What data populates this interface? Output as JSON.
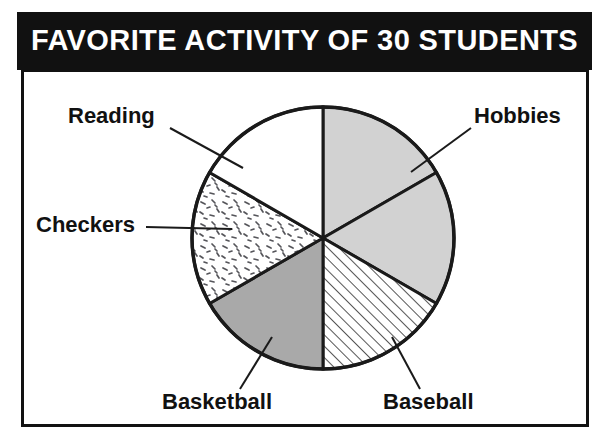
{
  "title": "FAVORITE ACTIVITY OF 30 STUDENTS",
  "labels": {
    "reading": "Reading",
    "checkers": "Checkers",
    "hobbies": "Hobbies",
    "basketball": "Basketball",
    "baseball": "Baseball"
  },
  "colors": {
    "banner_background": "#111111",
    "banner_text": "#ffffff",
    "frame_border": "#111111",
    "sector_outline": "#1a1a1a",
    "light_gray": "#d2d2d2",
    "mid_gray": "#a9a9a9",
    "white": "#ffffff"
  },
  "chart_data": {
    "type": "pie",
    "title": "FAVORITE ACTIVITY OF 30 STUDENTS",
    "total_students": 30,
    "categories": [
      "Hobbies",
      "Hobbies (second sector)",
      "Baseball",
      "Basketball",
      "Checkers",
      "Reading"
    ],
    "labeled_categories": [
      "Reading",
      "Hobbies",
      "Checkers",
      "Basketball",
      "Baseball"
    ],
    "slices": [
      {
        "label": "Hobbies",
        "value": 5,
        "fraction": 0.1667,
        "percent": 16.7,
        "degrees": 60,
        "start_angle_deg": 0,
        "end_angle_deg": 60,
        "fill": "#d2d2d2",
        "pattern": "solid-light-gray",
        "leader_line": true
      },
      {
        "label": "",
        "value": 5,
        "fraction": 0.1667,
        "percent": 16.7,
        "degrees": 60,
        "start_angle_deg": 60,
        "end_angle_deg": 120,
        "fill": "#d2d2d2",
        "pattern": "solid-light-gray",
        "leader_line": false
      },
      {
        "label": "Baseball",
        "value": 5,
        "fraction": 0.1667,
        "percent": 16.7,
        "degrees": 60,
        "start_angle_deg": 120,
        "end_angle_deg": 180,
        "fill": "#ffffff",
        "pattern": "diagonal-hatch",
        "leader_line": true
      },
      {
        "label": "Basketball",
        "value": 5,
        "fraction": 0.1667,
        "percent": 16.7,
        "degrees": 60,
        "start_angle_deg": 180,
        "end_angle_deg": 240,
        "fill": "#a9a9a9",
        "pattern": "solid-mid-gray",
        "leader_line": true
      },
      {
        "label": "Checkers",
        "value": 5,
        "fraction": 0.1667,
        "percent": 16.7,
        "degrees": 60,
        "start_angle_deg": 240,
        "end_angle_deg": 300,
        "fill": "#ffffff",
        "pattern": "speckle-dashes",
        "leader_line": true
      },
      {
        "label": "Reading",
        "value": 5,
        "fraction": 0.1667,
        "percent": 16.7,
        "degrees": 60,
        "start_angle_deg": 300,
        "end_angle_deg": 360,
        "fill": "#ffffff",
        "pattern": "plain-white",
        "leader_line": true
      }
    ],
    "legend_position": "callout-labels",
    "grid": false
  }
}
